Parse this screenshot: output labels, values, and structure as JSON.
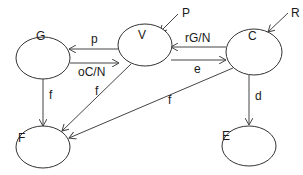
{
  "diagram": {
    "nodes": [
      {
        "id": "G",
        "label": "G",
        "cx": 43,
        "cy": 58,
        "rx": 27,
        "ry": 21,
        "lx": 36,
        "ly": 30
      },
      {
        "id": "V",
        "label": "V",
        "cx": 145,
        "cy": 45,
        "rx": 27,
        "ry": 21,
        "lx": 138,
        "ly": 29
      },
      {
        "id": "C",
        "label": "C",
        "cx": 254,
        "cy": 52,
        "rx": 28,
        "ry": 23,
        "lx": 248,
        "ly": 30
      },
      {
        "id": "F",
        "label": "F",
        "cx": 43,
        "cy": 147,
        "rx": 27,
        "ry": 21,
        "lx": 18,
        "ly": 132
      },
      {
        "id": "E",
        "label": "E",
        "cx": 249,
        "cy": 146,
        "rx": 27,
        "ry": 20,
        "lx": 222,
        "ly": 130
      }
    ],
    "inputs": [
      {
        "id": "P",
        "label": "P",
        "x1": 178,
        "y1": 14,
        "x2": 160,
        "y2": 32,
        "lx": 182,
        "ly": 17
      },
      {
        "id": "R",
        "label": "R",
        "x1": 288,
        "y1": 13,
        "x2": 268,
        "y2": 32,
        "lx": 291,
        "ly": 17
      }
    ],
    "edges": [
      {
        "from": "V",
        "to": "G",
        "label": "p",
        "x1": 118,
        "y1": 49,
        "x2": 69,
        "y2": 49,
        "lx": 91,
        "ly": 43
      },
      {
        "from": "G",
        "to": "V",
        "label": "oC/N",
        "x1": 70,
        "y1": 63,
        "x2": 119,
        "y2": 63,
        "lx": 78,
        "ly": 76
      },
      {
        "from": "C",
        "to": "V",
        "label": "rG/N",
        "x1": 226,
        "y1": 47,
        "x2": 171,
        "y2": 47,
        "lx": 185,
        "ly": 42
      },
      {
        "from": "V",
        "to": "C",
        "label": "e",
        "x1": 171,
        "y1": 60,
        "x2": 226,
        "y2": 60,
        "lx": 194,
        "ly": 73
      },
      {
        "from": "G",
        "to": "F",
        "label": "f",
        "x1": 43,
        "y1": 79,
        "x2": 43,
        "y2": 126,
        "lx": 49,
        "ly": 99
      },
      {
        "from": "V",
        "to": "F",
        "label": "f",
        "x1": 131,
        "y1": 64,
        "x2": 62,
        "y2": 131,
        "lx": 95,
        "ly": 95
      },
      {
        "from": "C",
        "to": "F",
        "label": "f",
        "x1": 233,
        "y1": 68,
        "x2": 69,
        "y2": 138,
        "lx": 168,
        "ly": 104
      },
      {
        "from": "C",
        "to": "E",
        "label": "d",
        "x1": 249,
        "y1": 75,
        "x2": 249,
        "y2": 125,
        "lx": 255,
        "ly": 100
      }
    ]
  }
}
